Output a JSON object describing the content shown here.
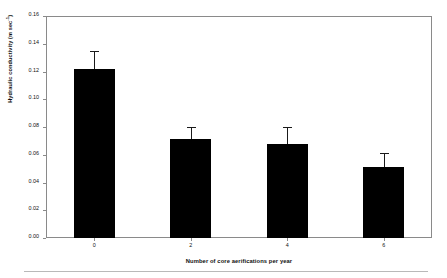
{
  "chart_data": {
    "type": "bar",
    "title": "",
    "subtitle": "",
    "xlabel": "Number of core aerifications per year",
    "ylabel": "Hydraulic conductivity (m sec",
    "ylabel_superscript": "-1",
    "ylabel_suffix": ")",
    "categories": [
      "0",
      "2",
      "4",
      "6"
    ],
    "values": [
      0.122,
      0.071,
      0.068,
      0.051
    ],
    "errors": [
      0.013,
      0.009,
      0.012,
      0.01
    ],
    "ylim": [
      0.0,
      0.16
    ],
    "ytick_values": [
      0.16,
      0.14,
      0.12,
      0.1,
      0.08,
      0.06,
      0.04,
      0.02,
      0.0
    ],
    "ytick_labels": [
      "0.16",
      "0.14",
      "0.12",
      "0.10",
      "0.08",
      "0.06",
      "0.04",
      "0.02",
      "0.00"
    ],
    "grid": false,
    "legend": false,
    "legend_position": "none",
    "bar_color": "#000000",
    "error_color": "#1a1a1a",
    "frame_color": "#8a8a8a",
    "background_color": "#ffffff"
  }
}
